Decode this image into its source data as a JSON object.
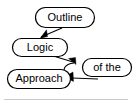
{
  "diagram": {
    "title": "Outline Logic Approach of the",
    "background_color": "#ffffff",
    "node_fill": "#ffffff",
    "node_stroke": "#000000",
    "edge_color": "#000000",
    "rule_color": "#c9c9c9",
    "nodes": [
      {
        "id": "outline",
        "label": "Outline",
        "shape": "stadium",
        "x": 35,
        "y": 7,
        "width": 60,
        "height": 21
      },
      {
        "id": "logic",
        "label": "Logic",
        "shape": "stadium",
        "x": 12,
        "y": 38,
        "width": 56,
        "height": 19
      },
      {
        "id": "approach",
        "label": "Approach",
        "shape": "stadium",
        "x": 7,
        "y": 69,
        "width": 64,
        "height": 20
      },
      {
        "id": "of_the",
        "label": "of the",
        "shape": "stadium",
        "x": 82,
        "y": 58,
        "width": 50,
        "height": 19
      }
    ],
    "edges": [
      {
        "id": "outline-to-logic",
        "from": "outline",
        "to": "logic",
        "arrowhead": "filled-triangle",
        "direction": "down-left"
      },
      {
        "id": "logic-to-mid",
        "from": "logic",
        "to": "of_the",
        "arrowhead": "filled-triangle",
        "direction": "down-right"
      },
      {
        "id": "of-the-to-approach",
        "from": "of_the",
        "to": "approach",
        "arrowhead": "filled-triangle",
        "direction": "left"
      },
      {
        "id": "mid-curve-to-approach",
        "from": "of_the",
        "to": "approach",
        "arrowhead": "filled-triangle",
        "direction": "curve-left"
      }
    ],
    "footer_rule": {
      "label": "horizontal-rule",
      "y": 99,
      "x1": 4,
      "x2": 128
    }
  }
}
